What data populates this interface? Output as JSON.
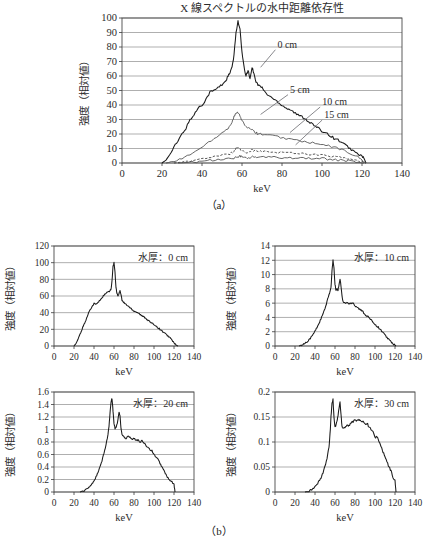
{
  "figure": {
    "caption_a": "（a）",
    "caption_b": "（b）",
    "axis_x_label": "keV",
    "axis_y_label": "強度（相対値）"
  },
  "chart_data": [
    {
      "id": "panel-a",
      "type": "line",
      "title": "X 線スペクトルの水中距離依存性",
      "xlabel": "keV",
      "ylabel": "強度（相対値）",
      "xlim": [
        0,
        140
      ],
      "ylim": [
        0,
        100
      ],
      "xticks": [
        0,
        20,
        40,
        60,
        80,
        100,
        120,
        140
      ],
      "yticks": [
        0,
        10,
        20,
        30,
        40,
        50,
        60,
        70,
        80,
        90,
        100
      ],
      "grid": true,
      "legend": "annotations",
      "annotations": [
        {
          "label": "0 cm",
          "x": 0.555,
          "y": 0.205
        },
        {
          "label": "5 cm",
          "x": 0.6,
          "y": 0.515
        },
        {
          "label": "10 cm",
          "x": 0.715,
          "y": 0.6
        },
        {
          "label": "15 cm",
          "x": 0.722,
          "y": 0.69
        }
      ],
      "series": [
        {
          "name": "0 cm",
          "x": [
            20,
            22,
            24,
            26,
            28,
            30,
            32,
            34,
            36,
            38,
            40,
            42,
            44,
            46,
            48,
            50,
            52,
            53,
            54,
            55,
            56,
            57,
            58,
            59,
            60,
            61,
            62,
            63,
            64,
            65,
            66,
            67,
            68,
            69,
            70,
            72,
            74,
            76,
            78,
            80,
            82,
            84,
            86,
            88,
            90,
            92,
            94,
            96,
            98,
            100,
            102,
            104,
            106,
            108,
            110,
            112,
            114,
            116,
            118,
            120,
            121,
            122
          ],
          "y": [
            0,
            2,
            6,
            11,
            15,
            20,
            24,
            30,
            33,
            38,
            40,
            44,
            49,
            50,
            52,
            54,
            57,
            60,
            62,
            66,
            74,
            90,
            98,
            92,
            76,
            66,
            60,
            64,
            58,
            66,
            62,
            56,
            54,
            53,
            52,
            48,
            46,
            44,
            42,
            40,
            38,
            37,
            35,
            33,
            32,
            30,
            28,
            26,
            24,
            22,
            21,
            19,
            17,
            16,
            14,
            12,
            10,
            8,
            6,
            5,
            3,
            0
          ]
        },
        {
          "name": "5 cm",
          "x": [
            22,
            26,
            30,
            34,
            38,
            42,
            46,
            50,
            53,
            55,
            56,
            57,
            58,
            59,
            60,
            62,
            64,
            65,
            66,
            67,
            68,
            70,
            74,
            78,
            82,
            86,
            90,
            94,
            98,
            102,
            106,
            110,
            114,
            118,
            120,
            122
          ],
          "y": [
            0,
            1,
            3,
            6,
            9,
            13,
            17,
            21,
            24,
            28,
            32,
            34,
            35,
            33,
            29,
            25,
            23,
            24,
            22,
            21,
            20,
            20,
            19,
            18,
            17,
            16,
            15,
            14,
            13,
            12,
            11,
            9,
            7,
            4,
            2,
            0
          ]
        },
        {
          "name": "10 cm",
          "x": [
            26,
            30,
            34,
            38,
            42,
            46,
            50,
            54,
            56,
            57,
            58,
            59,
            60,
            62,
            64,
            65,
            66,
            68,
            70,
            74,
            78,
            82,
            86,
            90,
            94,
            98,
            102,
            106,
            110,
            114,
            118,
            120,
            122
          ],
          "y": [
            0,
            0.6,
            1.4,
            2.3,
            3.2,
            4.2,
            5.2,
            6.4,
            8,
            10.5,
            11,
            9.5,
            8,
            7.6,
            8.2,
            9.2,
            8.6,
            8,
            7.8,
            7.6,
            7.4,
            7.2,
            7,
            6.6,
            6.2,
            5.6,
            5,
            4.4,
            3.6,
            2.6,
            1.4,
            0.6,
            0
          ]
        },
        {
          "name": "15 cm",
          "x": [
            28,
            32,
            36,
            40,
            44,
            48,
            52,
            56,
            58,
            59,
            60,
            62,
            64,
            66,
            68,
            72,
            76,
            80,
            84,
            88,
            92,
            96,
            100,
            104,
            108,
            112,
            116,
            119,
            121
          ],
          "y": [
            0,
            0.3,
            0.7,
            1.2,
            1.7,
            2.2,
            2.8,
            3.4,
            4.2,
            4.6,
            4.2,
            3.6,
            3.8,
            4.2,
            4,
            3.9,
            3.9,
            3.8,
            3.7,
            3.6,
            3.4,
            3.2,
            3,
            2.6,
            2.1,
            1.6,
            0.9,
            0.3,
            0
          ]
        }
      ]
    },
    {
      "id": "panel-b-0cm",
      "type": "line",
      "panel_label": "水厚：0 cm",
      "xlabel": "keV",
      "ylabel": "強度（相対値）",
      "xlim": [
        0,
        140
      ],
      "ylim": [
        0,
        120
      ],
      "xticks": [
        0,
        20,
        40,
        60,
        80,
        100,
        120,
        140
      ],
      "yticks": [
        0,
        20,
        40,
        60,
        80,
        100,
        120
      ],
      "grid": true,
      "series": [
        {
          "name": "0 cm",
          "x": [
            20,
            22,
            24,
            26,
            28,
            30,
            32,
            34,
            36,
            38,
            40,
            42,
            44,
            46,
            48,
            50,
            52,
            54,
            56,
            57,
            58,
            59,
            60,
            61,
            62,
            63,
            64,
            65,
            66,
            67,
            68,
            69,
            70,
            72,
            74,
            76,
            78,
            80,
            82,
            84,
            86,
            88,
            90,
            92,
            94,
            96,
            98,
            100,
            102,
            104,
            106,
            108,
            110,
            112,
            114,
            116,
            118,
            120,
            122,
            124
          ],
          "y": [
            0,
            3,
            8,
            14,
            20,
            26,
            31,
            38,
            44,
            47,
            51,
            50,
            52,
            55,
            58,
            61,
            63,
            65,
            66,
            68,
            78,
            95,
            100,
            88,
            70,
            63,
            60,
            63,
            67,
            62,
            55,
            53,
            52,
            50,
            48,
            46,
            44,
            42,
            41,
            40,
            38,
            36,
            35,
            33,
            31,
            29,
            27,
            26,
            24,
            22,
            20,
            18,
            16,
            14,
            12,
            10,
            7,
            4,
            1,
            0
          ]
        }
      ]
    },
    {
      "id": "panel-b-10cm",
      "type": "line",
      "panel_label": "水厚：10 cm",
      "xlabel": "keV",
      "ylabel": "強度（相対値）",
      "xlim": [
        0,
        140
      ],
      "ylim": [
        0,
        14
      ],
      "xticks": [
        0,
        20,
        40,
        60,
        80,
        100,
        120,
        140
      ],
      "yticks": [
        0,
        2,
        4,
        6,
        8,
        10,
        12,
        14
      ],
      "grid": true,
      "series": [
        {
          "name": "10 cm",
          "x": [
            24,
            26,
            28,
            30,
            32,
            34,
            36,
            38,
            40,
            42,
            44,
            46,
            48,
            50,
            52,
            54,
            56,
            57,
            58,
            59,
            60,
            61,
            62,
            63,
            64,
            65,
            66,
            67,
            68,
            70,
            72,
            74,
            76,
            78,
            80,
            82,
            84,
            86,
            88,
            90,
            92,
            94,
            96,
            98,
            100,
            102,
            104,
            106,
            108,
            110,
            112,
            114,
            116,
            118,
            120,
            121
          ],
          "y": [
            0,
            0.1,
            0.2,
            0.4,
            0.6,
            0.9,
            1.2,
            1.6,
            2.1,
            2.6,
            3.2,
            3.8,
            4.5,
            5.2,
            6.2,
            7.2,
            8.2,
            10.5,
            12,
            10.8,
            8.6,
            7.8,
            8,
            7.8,
            8.6,
            9.4,
            8.4,
            7,
            6.2,
            6,
            6.1,
            5.9,
            6,
            6.1,
            5.6,
            5.5,
            5.2,
            5,
            4.8,
            4.4,
            4.2,
            4,
            3.6,
            3.4,
            3,
            2.8,
            2.5,
            2.2,
            1.9,
            1.5,
            1.2,
            0.9,
            0.6,
            0.3,
            0.1,
            0
          ]
        }
      ]
    },
    {
      "id": "panel-b-20cm",
      "type": "line",
      "panel_label": "水厚：20 cm",
      "xlabel": "keV",
      "ylabel": "強度（相対値）",
      "xlim": [
        0,
        140
      ],
      "ylim": [
        0,
        1.6
      ],
      "xticks": [
        0,
        20,
        40,
        60,
        80,
        100,
        120,
        140
      ],
      "yticks": [
        0,
        0.2,
        0.4,
        0.6,
        0.8,
        1,
        1.2,
        1.4,
        1.6
      ],
      "grid": true,
      "series": [
        {
          "name": "20 cm",
          "x": [
            26,
            30,
            34,
            36,
            38,
            40,
            42,
            44,
            46,
            48,
            50,
            52,
            54,
            55,
            56,
            57,
            58,
            59,
            60,
            61,
            62,
            63,
            64,
            65,
            66,
            67,
            68,
            70,
            72,
            74,
            76,
            78,
            80,
            82,
            84,
            86,
            88,
            90,
            92,
            94,
            96,
            98,
            100,
            102,
            104,
            106,
            108,
            110,
            112,
            114,
            116,
            118,
            120,
            121
          ],
          "y": [
            0,
            0.02,
            0.06,
            0.09,
            0.13,
            0.18,
            0.24,
            0.31,
            0.4,
            0.5,
            0.62,
            0.76,
            0.92,
            1.05,
            1.25,
            1.44,
            1.5,
            1.3,
            1.1,
            1.02,
            1.04,
            1.08,
            1.16,
            1.28,
            1.22,
            1.02,
            0.92,
            0.88,
            0.86,
            0.9,
            0.88,
            0.84,
            0.86,
            0.82,
            0.84,
            0.8,
            0.82,
            0.78,
            0.74,
            0.72,
            0.68,
            0.66,
            0.6,
            0.56,
            0.52,
            0.46,
            0.4,
            0.34,
            0.28,
            0.22,
            0.18,
            0.16,
            0.12,
            0
          ]
        }
      ]
    },
    {
      "id": "panel-b-30cm",
      "type": "line",
      "panel_label": "水厚：30 cm",
      "xlabel": "keV",
      "ylabel": "強度（相対値）",
      "xlim": [
        0,
        140
      ],
      "ylim": [
        0,
        0.2
      ],
      "xticks": [
        0,
        20,
        40,
        60,
        80,
        100,
        120,
        140
      ],
      "yticks": [
        0,
        0.05,
        0.1,
        0.15,
        0.2
      ],
      "grid": true,
      "series": [
        {
          "name": "30 cm",
          "x": [
            30,
            34,
            38,
            40,
            42,
            44,
            46,
            48,
            50,
            52,
            54,
            55,
            56,
            57,
            58,
            59,
            60,
            61,
            62,
            63,
            64,
            65,
            66,
            67,
            68,
            70,
            72,
            74,
            76,
            78,
            80,
            82,
            84,
            86,
            88,
            90,
            92,
            94,
            96,
            98,
            100,
            102,
            104,
            106,
            108,
            110,
            112,
            114,
            116,
            118,
            120,
            121
          ],
          "y": [
            0,
            0.002,
            0.006,
            0.01,
            0.015,
            0.021,
            0.029,
            0.039,
            0.051,
            0.066,
            0.09,
            0.115,
            0.15,
            0.178,
            0.185,
            0.15,
            0.13,
            0.134,
            0.142,
            0.152,
            0.168,
            0.18,
            0.155,
            0.132,
            0.128,
            0.13,
            0.134,
            0.132,
            0.138,
            0.141,
            0.146,
            0.142,
            0.145,
            0.14,
            0.143,
            0.136,
            0.138,
            0.13,
            0.126,
            0.12,
            0.108,
            0.112,
            0.1,
            0.092,
            0.08,
            0.07,
            0.06,
            0.05,
            0.042,
            0.03,
            0.022,
            0
          ]
        }
      ]
    }
  ]
}
